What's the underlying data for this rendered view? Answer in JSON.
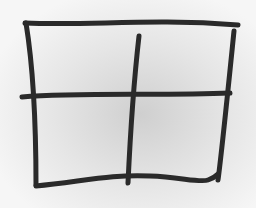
{
  "drawing": {
    "subject": "hand-drawn 2x2 grid",
    "stroke_color": "#2a2a2a",
    "paper_color": "#f4f4f4",
    "rows": 2,
    "cols": 2
  }
}
